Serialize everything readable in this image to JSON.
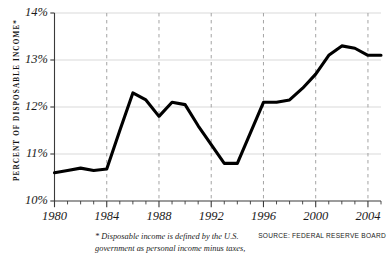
{
  "chart_data": {
    "type": "line",
    "title": "",
    "subtitle": "",
    "xlabel": "",
    "ylabel": "PERCENT OF DISPOSABLE INCOME*",
    "xlim": [
      1980,
      2005
    ],
    "ylim": [
      10,
      14
    ],
    "grid": true,
    "legend_position": "none",
    "y_ticks": [
      "10%",
      "11%",
      "12%",
      "13%",
      "14%"
    ],
    "y_tick_values": [
      10,
      11,
      12,
      13,
      14
    ],
    "x_ticks": [
      "1980",
      "1984",
      "1988",
      "1992",
      "1996",
      "2000",
      "2004"
    ],
    "x_tick_values": [
      1980,
      1984,
      1988,
      1992,
      1996,
      2000,
      2004
    ],
    "x_minor_tick_step": 1,
    "series": [
      {
        "name": "Debt service as percent of disposable income",
        "color": "#000000",
        "x": [
          1980,
          1981,
          1982,
          1983,
          1984,
          1985,
          1986,
          1987,
          1988,
          1989,
          1990,
          1991,
          1992,
          1993,
          1994,
          1995,
          1996,
          1997,
          1998,
          1999,
          2000,
          2001,
          2002,
          2003,
          2004,
          2005
        ],
        "values": [
          10.6,
          10.65,
          10.7,
          10.65,
          10.68,
          11.5,
          12.3,
          12.15,
          11.8,
          12.1,
          12.05,
          11.6,
          11.2,
          10.8,
          10.8,
          11.45,
          12.1,
          12.1,
          12.15,
          12.4,
          12.7,
          13.1,
          13.3,
          13.25,
          13.1,
          13.1
        ]
      }
    ],
    "footnote": "* Disposable income is defined by the U.S. government as personal income minus taxes,",
    "source": "SOURCE: FEDERAL RESERVE BOARD"
  },
  "colors": {
    "line": "#000000",
    "axis": "#3a3a3a",
    "hgrid": "#cfcfcf",
    "vgrid": "#9a9a9a",
    "text": "#1a1a1a",
    "background": "#ffffff"
  },
  "axis": {
    "y_title": "PERCENT OF DISPOSABLE INCOME*"
  },
  "notes": {
    "footnote": "* Disposable income is defined by the U.S. government as personal income minus taxes,",
    "source": "SOURCE: FEDERAL RESERVE BOARD"
  }
}
